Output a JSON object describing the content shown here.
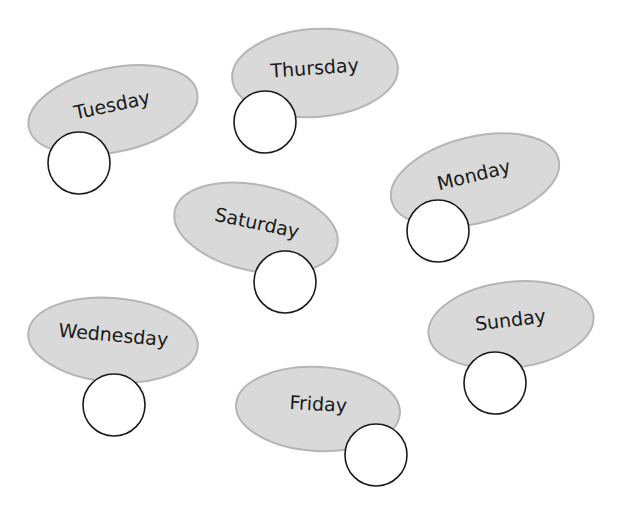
{
  "colors": {
    "bubble_fill": "#d9d9d9",
    "bubble_stroke": "#b5b5b5",
    "circle_fill": "#ffffff",
    "circle_stroke": "#1a1a1a",
    "text": "#1a1a1a"
  },
  "items": [
    {
      "label": "Tuesday",
      "ellipse": {
        "cx": 113,
        "cy": 110,
        "rx": 86,
        "ry": 42,
        "rotate": -12
      },
      "circle": {
        "cx": 79,
        "cy": 163,
        "r": 31
      }
    },
    {
      "label": "Thursday",
      "ellipse": {
        "cx": 315,
        "cy": 73,
        "rx": 83,
        "ry": 44,
        "rotate": -4
      },
      "circle": {
        "cx": 265,
        "cy": 122,
        "r": 31
      }
    },
    {
      "label": "Monday",
      "ellipse": {
        "cx": 475,
        "cy": 180,
        "rx": 86,
        "ry": 43,
        "rotate": -14
      },
      "circle": {
        "cx": 438,
        "cy": 231,
        "r": 31
      }
    },
    {
      "label": "Saturday",
      "ellipse": {
        "cx": 256,
        "cy": 228,
        "rx": 83,
        "ry": 43,
        "rotate": 12
      },
      "circle": {
        "cx": 285,
        "cy": 282,
        "r": 31
      }
    },
    {
      "label": "Wednesday",
      "ellipse": {
        "cx": 113,
        "cy": 340,
        "rx": 85,
        "ry": 42,
        "rotate": 5
      },
      "circle": {
        "cx": 114,
        "cy": 405,
        "r": 31
      }
    },
    {
      "label": "Friday",
      "ellipse": {
        "cx": 318,
        "cy": 409,
        "rx": 82,
        "ry": 42,
        "rotate": 3
      },
      "circle": {
        "cx": 376,
        "cy": 455,
        "r": 31
      }
    },
    {
      "label": "Sunday",
      "ellipse": {
        "cx": 511,
        "cy": 325,
        "rx": 83,
        "ry": 43,
        "rotate": -7
      },
      "circle": {
        "cx": 495,
        "cy": 383,
        "r": 31
      }
    }
  ]
}
